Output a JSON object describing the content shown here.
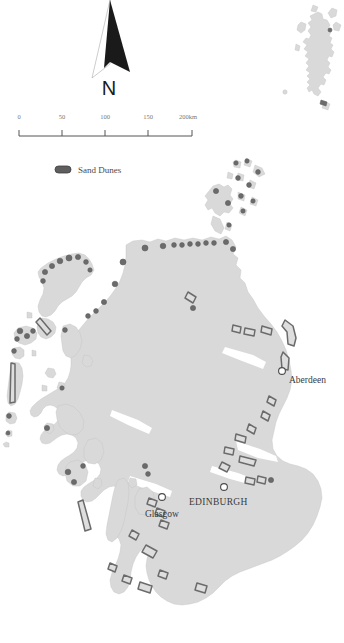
{
  "map": {
    "title": "Sand Dunes of Scotland",
    "region": "Scotland",
    "background_color": "#ffffff",
    "land_color": "#d9d9d9",
    "land_stroke_color": "#c2c2c2",
    "dune_stroke_color": "#6b6b6b",
    "dune_fill_color": "#dedede"
  },
  "north_arrow": {
    "label": "N",
    "name": "north-arrow"
  },
  "scale_bar": {
    "unit_suffix": "km",
    "ticks": [
      {
        "label": "0",
        "value": 0
      },
      {
        "label": "50",
        "value": 50
      },
      {
        "label": "100",
        "value": 100
      },
      {
        "label": "150",
        "value": 150
      },
      {
        "label": "200km",
        "value": 200
      }
    ]
  },
  "legend": {
    "items": [
      {
        "label": "Sand Dunes",
        "symbol": "pill",
        "color": "#5e5e5e"
      }
    ]
  },
  "cities": [
    {
      "name": "Aberdeen",
      "style": "mixed",
      "x": 287,
      "y": 375,
      "label_x": 292,
      "label_y": 387,
      "anchor": "start"
    },
    {
      "name": "EDINBURGH",
      "style": "caps",
      "x": 186,
      "y": 492,
      "label_x": 191,
      "label_y": 505,
      "anchor": "start"
    },
    {
      "name": "Glasgow",
      "style": "mixed",
      "x": 162,
      "y": 497,
      "label_x": 146,
      "label_y": 515,
      "anchor": "start"
    }
  ],
  "island_groups": [
    {
      "name": "Shetland Islands",
      "position": "inset-top-right"
    },
    {
      "name": "Orkney Islands",
      "position": "north"
    },
    {
      "name": "Outer Hebrides",
      "position": "northwest"
    },
    {
      "name": "Inner Hebrides",
      "position": "west"
    },
    {
      "name": "Scottish Mainland",
      "position": "center"
    }
  ]
}
